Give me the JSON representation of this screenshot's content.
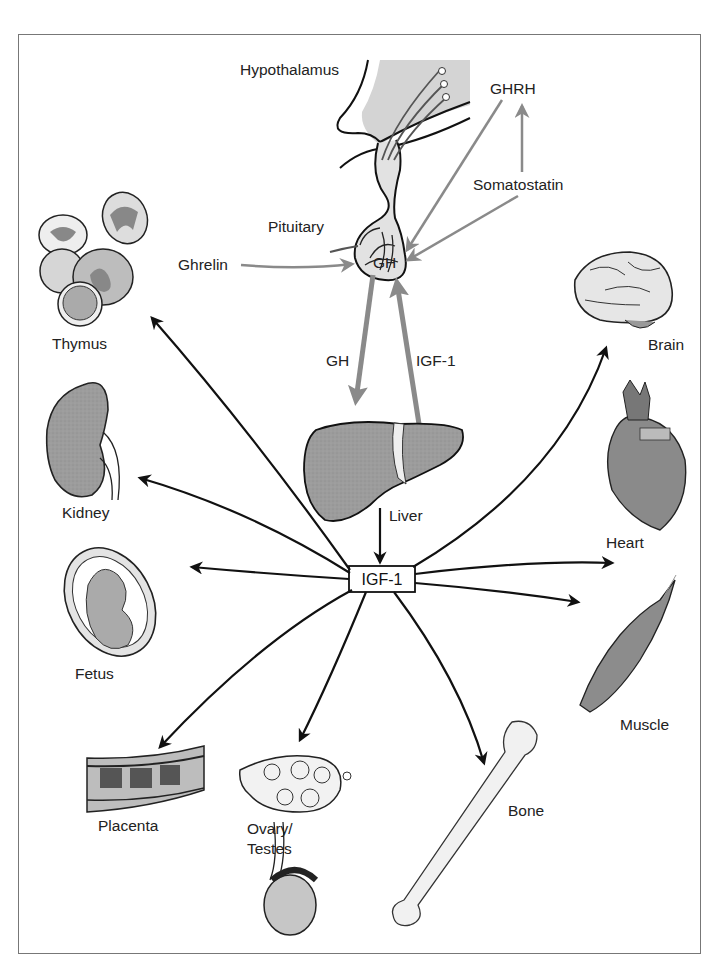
{
  "diagram": {
    "title": "",
    "center_node": "IGF-1",
    "labels": {
      "hypothalamus": "Hypothalamus",
      "pituitary": "Pituitary",
      "ghrh": "GHRH",
      "somatostatin": "Somatostatin",
      "ghrelin": "Ghrelin",
      "gh_pituitary": "GH",
      "gh_arrow": "GH",
      "igf1_arrow": "IGF-1",
      "liver": "Liver",
      "thymus": "Thymus",
      "kidney": "Kidney",
      "fetus": "Fetus",
      "placenta": "Placenta",
      "ovary_line1": "Ovary/",
      "ovary_line2": "Testes",
      "bone": "Bone",
      "muscle": "Muscle",
      "heart": "Heart",
      "brain": "Brain"
    },
    "edges": [
      {
        "from": "GHRH",
        "to": "GH",
        "style": "gray"
      },
      {
        "from": "Somatostatin",
        "to": "GH",
        "style": "gray"
      },
      {
        "from": "Somatostatin",
        "to": "GHRH",
        "style": "gray"
      },
      {
        "from": "Ghrelin",
        "to": "GH",
        "style": "gray"
      },
      {
        "from": "GH",
        "to": "Liver",
        "style": "gray-thick"
      },
      {
        "from": "Liver",
        "to": "GH",
        "label": "IGF-1",
        "style": "gray-thick"
      },
      {
        "from": "Liver",
        "to": "IGF-1",
        "style": "black"
      },
      {
        "from": "IGF-1",
        "to": "Thymus",
        "style": "black"
      },
      {
        "from": "IGF-1",
        "to": "Kidney",
        "style": "black"
      },
      {
        "from": "IGF-1",
        "to": "Fetus",
        "style": "black"
      },
      {
        "from": "IGF-1",
        "to": "Placenta",
        "style": "black"
      },
      {
        "from": "IGF-1",
        "to": "Ovary/Testes",
        "style": "black"
      },
      {
        "from": "IGF-1",
        "to": "Bone",
        "style": "black"
      },
      {
        "from": "IGF-1",
        "to": "Muscle",
        "style": "black"
      },
      {
        "from": "IGF-1",
        "to": "Heart",
        "style": "black"
      },
      {
        "from": "IGF-1",
        "to": "Brain",
        "style": "black"
      }
    ],
    "colors": {
      "gray_arrow": "#8a8a8a",
      "black_arrow": "#111111",
      "organ_fill": "#9a9a9a",
      "light_fill": "#d8d8d8"
    }
  }
}
